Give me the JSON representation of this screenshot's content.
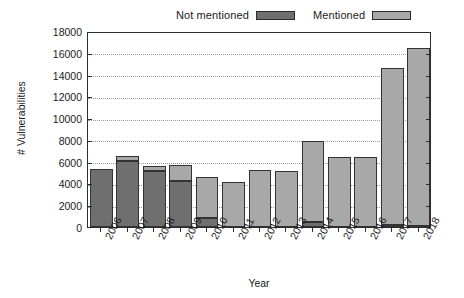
{
  "chart_data": {
    "type": "bar",
    "subtype": "stacked-bar",
    "title": "",
    "xlabel": "Year",
    "ylabel": "# Vulnerabilities",
    "categories": [
      "2006",
      "2007",
      "2008",
      "2009",
      "2010",
      "2011",
      "2012",
      "2013",
      "2014",
      "2015",
      "2016",
      "2017",
      "2018"
    ],
    "series": [
      {
        "name": "Not mentioned",
        "color": "#6f6f6f",
        "values": [
          5300,
          6100,
          5100,
          4200,
          800,
          0,
          0,
          0,
          500,
          0,
          0,
          150,
          100
        ]
      },
      {
        "name": "Mentioned",
        "color": "#a8a8a8",
        "values": [
          0,
          400,
          500,
          1500,
          3800,
          4100,
          5200,
          5150,
          7400,
          6450,
          6400,
          14450,
          16300
        ]
      }
    ],
    "totals": [
      5300,
      6500,
      5600,
      5700,
      4600,
      4100,
      5200,
      5150,
      7900,
      6450,
      6400,
      14600,
      16400
    ],
    "ylim": [
      0,
      18000
    ],
    "ytick_labels": [
      "0",
      "2000",
      "4000",
      "6000",
      "8000",
      "10000",
      "12000",
      "14000",
      "16000",
      "18000"
    ],
    "ytick_values": [
      0,
      2000,
      4000,
      6000,
      8000,
      10000,
      12000,
      14000,
      16000,
      18000
    ],
    "grid": true,
    "grid_axis": "y",
    "legend_position": "top",
    "legend": [
      "Not mentioned",
      "Mentioned"
    ]
  }
}
